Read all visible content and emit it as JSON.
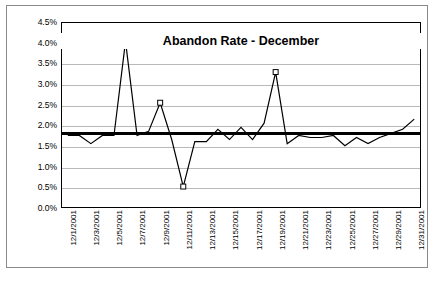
{
  "chart_data": {
    "type": "line",
    "title": "Abandon Rate - December",
    "xlabel": "",
    "ylabel": "",
    "ylim": [
      0,
      0.045
    ],
    "ytick_labels": [
      "0.0%",
      "0.5%",
      "1.0%",
      "1.5%",
      "2.0%",
      "2.5%",
      "3.0%",
      "3.5%",
      "4.0%",
      "4.5%"
    ],
    "ytick_values": [
      0.0,
      0.5,
      1.0,
      1.5,
      2.0,
      2.5,
      3.0,
      3.5,
      4.0,
      4.5
    ],
    "grid": true,
    "legend": "none",
    "x_tick_labels": [
      "12/1/2001",
      "12/3/2001",
      "12/5/2001",
      "12/7/2001",
      "12/9/2001",
      "12/11/2001",
      "12/13/2001",
      "12/15/2001",
      "12/17/2001",
      "12/19/2001",
      "12/21/2001",
      "12/23/2001",
      "12/25/2001",
      "12/27/2001",
      "12/29/2001",
      "12/31/2001"
    ],
    "categories": [
      "12/1/2001",
      "12/2/2001",
      "12/3/2001",
      "12/4/2001",
      "12/5/2001",
      "12/6/2001",
      "12/7/2001",
      "12/8/2001",
      "12/9/2001",
      "12/10/2001",
      "12/11/2001",
      "12/12/2001",
      "12/13/2001",
      "12/14/2001",
      "12/15/2001",
      "12/16/2001",
      "12/17/2001",
      "12/18/2001",
      "12/19/2001",
      "12/20/2001",
      "12/21/2001",
      "12/22/2001",
      "12/23/2001",
      "12/24/2001",
      "12/25/2001",
      "12/26/2001",
      "12/27/2001",
      "12/28/2001",
      "12/29/2001",
      "12/30/2001",
      "12/31/2001"
    ],
    "series": [
      {
        "name": "Abandon Rate",
        "type": "line",
        "color": "#000000",
        "values": [
          1.75,
          1.75,
          1.55,
          1.75,
          1.75,
          4.05,
          1.75,
          1.85,
          2.55,
          1.65,
          0.5,
          1.6,
          1.6,
          1.9,
          1.65,
          1.95,
          1.65,
          2.05,
          3.3,
          1.55,
          1.75,
          1.7,
          1.7,
          1.75,
          1.5,
          1.7,
          1.55,
          1.7,
          1.8,
          1.9,
          2.15
        ],
        "markers": [
          {
            "x": "12/6/2001",
            "y": 4.05
          },
          {
            "x": "12/9/2001",
            "y": 2.55
          },
          {
            "x": "12/11/2001",
            "y": 0.5
          },
          {
            "x": "12/19/2001",
            "y": 3.3
          }
        ]
      },
      {
        "name": "Goal",
        "type": "reference-line",
        "color": "#000000",
        "value": 1.8,
        "style": "thick-horizontal"
      }
    ]
  }
}
